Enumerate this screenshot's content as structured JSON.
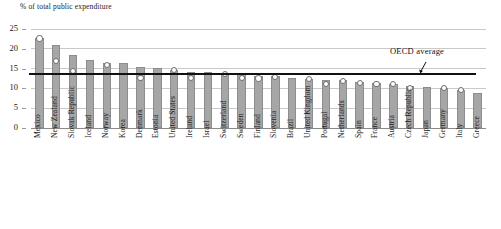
{
  "chart_data": {
    "type": "bar",
    "title": "% of total public expenditure",
    "xlabel": "",
    "ylabel": "% of total public expenditure",
    "ylim": [
      0,
      25
    ],
    "yticks": [
      0,
      5,
      10,
      15,
      20,
      25
    ],
    "grid": true,
    "legend": "none",
    "categories": [
      "Mexico",
      "New Zealand",
      "Slovak Republic",
      "Iceland",
      "Norway",
      "Korea",
      "Denmark",
      "Estonia",
      "United States",
      "Ireland",
      "Israel",
      "Switzerland",
      "Sweden",
      "Finland",
      "Slovenia",
      "Brazil",
      "United Kingdom",
      "Portugal",
      "Netherlands",
      "Spain",
      "France",
      "Austria",
      "Czech Republic",
      "Japan",
      "Germany",
      "Italy",
      "Greece"
    ],
    "series": [
      {
        "name": "bars",
        "values": [
          22.7,
          20.9,
          18.4,
          17.1,
          16.5,
          16.4,
          15.3,
          15.1,
          14.6,
          14.2,
          14.1,
          13.9,
          13.7,
          13.2,
          13.1,
          12.6,
          12.5,
          12.2,
          12.0,
          11.6,
          11.3,
          11.2,
          10.5,
          10.4,
          10.1,
          9.7,
          8.8
        ]
      },
      {
        "name": "markers",
        "values": [
          22.6,
          16.9,
          14.3,
          null,
          16.0,
          null,
          12.7,
          null,
          14.6,
          12.6,
          null,
          13.7,
          12.6,
          12.5,
          12.9,
          null,
          12.3,
          11.2,
          11.9,
          11.4,
          11.2,
          11.2,
          10.2,
          null,
          10.1,
          9.6,
          null
        ]
      }
    ],
    "annotations": [
      {
        "text": "OECD average",
        "value": 13.7,
        "type": "hline-with-arrow"
      }
    ]
  },
  "axis": {
    "ytick_labels": [
      "25",
      "20",
      "15",
      "10",
      "5",
      "0"
    ]
  },
  "header": {
    "axis_title": "% of total public expenditure"
  }
}
